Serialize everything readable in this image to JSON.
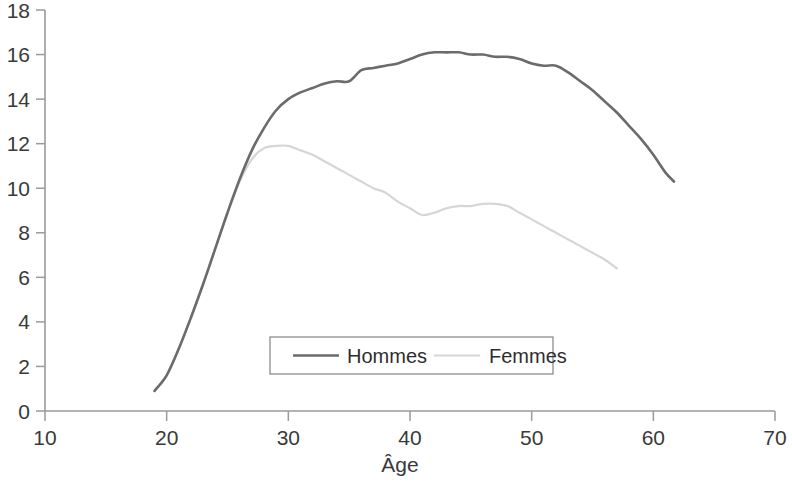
{
  "chart_data": {
    "type": "line",
    "title": "",
    "subtitle": "",
    "xlabel": "Âge",
    "ylabel": "",
    "xlim": [
      10,
      70
    ],
    "ylim": [
      0,
      18
    ],
    "xticks": [
      10,
      20,
      30,
      40,
      50,
      60,
      70
    ],
    "yticks": [
      0,
      2,
      4,
      6,
      8,
      10,
      12,
      14,
      16,
      18
    ],
    "xtick_labels": [
      "10",
      "20",
      "30",
      "40",
      "50",
      "60",
      "70"
    ],
    "ytick_labels": [
      "0",
      "2",
      "4",
      "6",
      "8",
      "10",
      "12",
      "14",
      "16",
      "18"
    ],
    "grid": false,
    "legend_position": "lower center",
    "series": [
      {
        "name": "Hommes",
        "color": "#6b6b6b",
        "width": 2.6,
        "x": [
          19.0,
          20.0,
          21.0,
          22.0,
          23.0,
          24.0,
          25.0,
          26.0,
          27.0,
          28.0,
          29.0,
          30.0,
          31.0,
          32.0,
          33.0,
          34.0,
          35.0,
          36.0,
          37.0,
          38.0,
          39.0,
          40.0,
          41.0,
          42.0,
          43.0,
          44.0,
          45.0,
          46.0,
          47.0,
          48.0,
          49.0,
          50.0,
          51.0,
          52.0,
          53.0,
          54.0,
          55.0,
          56.0,
          57.0,
          58.0,
          59.0,
          60.0,
          61.0,
          61.7
        ],
        "y": [
          0.9,
          1.6,
          2.8,
          4.2,
          5.7,
          7.3,
          8.9,
          10.4,
          11.7,
          12.7,
          13.5,
          14.0,
          14.3,
          14.5,
          14.7,
          14.8,
          14.8,
          15.3,
          15.4,
          15.5,
          15.6,
          15.8,
          16.0,
          16.1,
          16.1,
          16.1,
          16.0,
          16.0,
          15.9,
          15.9,
          15.8,
          15.6,
          15.5,
          15.5,
          15.2,
          14.8,
          14.4,
          13.9,
          13.4,
          12.8,
          12.2,
          11.5,
          10.7,
          10.3
        ]
      },
      {
        "name": "Femmes",
        "color": "#d6d6d6",
        "width": 2.2,
        "x": [
          19.0,
          20.0,
          21.0,
          22.0,
          23.0,
          24.0,
          25.0,
          26.0,
          27.0,
          28.0,
          29.0,
          30.0,
          31.0,
          32.0,
          33.0,
          34.0,
          35.0,
          36.0,
          37.0,
          38.0,
          39.0,
          40.0,
          41.0,
          42.0,
          43.0,
          44.0,
          45.0,
          46.0,
          47.0,
          48.0,
          49.0,
          50.0,
          51.0,
          52.0,
          53.0,
          54.0,
          55.0,
          56.0,
          57.0
        ],
        "y": [
          0.9,
          1.6,
          2.8,
          4.2,
          5.7,
          7.3,
          8.9,
          10.3,
          11.3,
          11.8,
          11.9,
          11.9,
          11.7,
          11.5,
          11.2,
          10.9,
          10.6,
          10.3,
          10.0,
          9.8,
          9.4,
          9.1,
          8.8,
          8.9,
          9.1,
          9.2,
          9.2,
          9.3,
          9.3,
          9.2,
          8.9,
          8.6,
          8.3,
          8.0,
          7.7,
          7.4,
          7.1,
          6.8,
          6.4
        ]
      }
    ],
    "legend": [
      {
        "label": "Hommes",
        "color": "#6b6b6b",
        "style": "solid"
      },
      {
        "label": "Femmes",
        "color": "#d6d6d6",
        "style": "solid"
      }
    ]
  },
  "axis": {
    "color": "#9a9a9a"
  }
}
